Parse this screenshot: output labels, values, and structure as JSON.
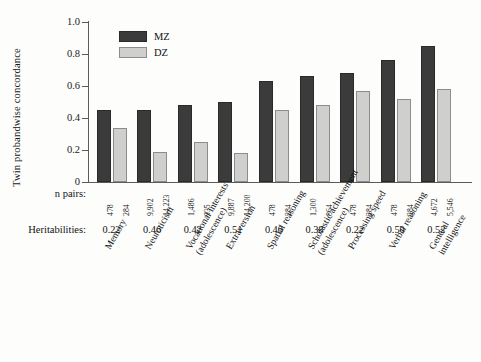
{
  "chart_data": {
    "type": "bar",
    "title": "",
    "subtitle": "",
    "xlabel": "",
    "ylabel": "Twin probandwise concordance",
    "ylim": [
      0,
      1.0
    ],
    "yticks": [
      "0",
      "0.2",
      "0.4",
      "0.6",
      "0.8",
      "1.0"
    ],
    "grid": false,
    "legend_position": "top-left-inside",
    "categories": [
      "Memory",
      "Neuroticism",
      "Vocational interests (adolescence)",
      "Extraversion",
      "Spatial reasoning",
      "Scholastic achievement (adolescence)",
      "Processing speed",
      "Verbal reasoning",
      "General intelligence"
    ],
    "category_lines": [
      [
        "Memory",
        ""
      ],
      [
        "Neuroticism",
        ""
      ],
      [
        "Vocational interests",
        "(adolescence)"
      ],
      [
        "Extraversion",
        ""
      ],
      [
        "Spatial reasoning",
        ""
      ],
      [
        "Scholastic achievement",
        "(adolescence)"
      ],
      [
        "Processing speed",
        ""
      ],
      [
        "Verbal reasoning",
        ""
      ],
      [
        "General",
        "intelligence"
      ]
    ],
    "series": [
      {
        "name": "MZ",
        "values": [
          0.45,
          0.45,
          0.48,
          0.5,
          0.63,
          0.66,
          0.68,
          0.76,
          0.85
        ]
      },
      {
        "name": "DZ",
        "values": [
          0.34,
          0.19,
          0.25,
          0.18,
          0.45,
          0.48,
          0.57,
          0.52,
          0.58
        ]
      }
    ],
    "annotation_rows": [
      {
        "label": "n pairs:",
        "values_mz": [
          "478",
          "9,902",
          "1,486",
          "9,887",
          "478",
          "1,300",
          "478",
          "478",
          "4,672"
        ],
        "values_dz": [
          "284",
          "14,223",
          "935",
          "14,200",
          "284",
          "864",
          "284",
          "284",
          "5,546"
        ]
      },
      {
        "label": "Heritabilities:",
        "values": [
          "0.22",
          "0.46",
          "0.42",
          "0.51",
          "0.40",
          "0.38",
          "0.22",
          "0.50",
          "0.52"
        ]
      }
    ]
  },
  "legend": {
    "items": [
      {
        "key": "mz",
        "label": "MZ",
        "color": "#3b3b3b"
      },
      {
        "key": "dz",
        "label": "DZ",
        "color": "#cfcfcd"
      }
    ]
  },
  "axis": {
    "y_title": "Twin probandwise concordance",
    "y_tick_labels": [
      "1.0",
      "0.8",
      "0.6",
      "0.4",
      "0.2",
      "0"
    ]
  },
  "labels": {
    "npairs_row": "n pairs:",
    "heritabilities_row": "Heritabilities:"
  },
  "colors": {
    "mz_fill": "#3b3b3b",
    "dz_fill": "#cfcfcd",
    "axis": "#5a5a5a",
    "background": "#fdfdfc",
    "text": "#131313"
  }
}
